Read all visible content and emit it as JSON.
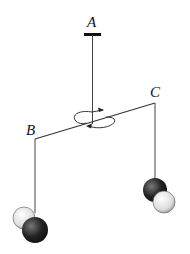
{
  "diagram": {
    "labels": {
      "a": "A",
      "b": "B",
      "c": "C"
    },
    "colors": {
      "line": "#333333",
      "dark_sphere": "#222222",
      "light_sphere": "#e6e6e6"
    }
  }
}
